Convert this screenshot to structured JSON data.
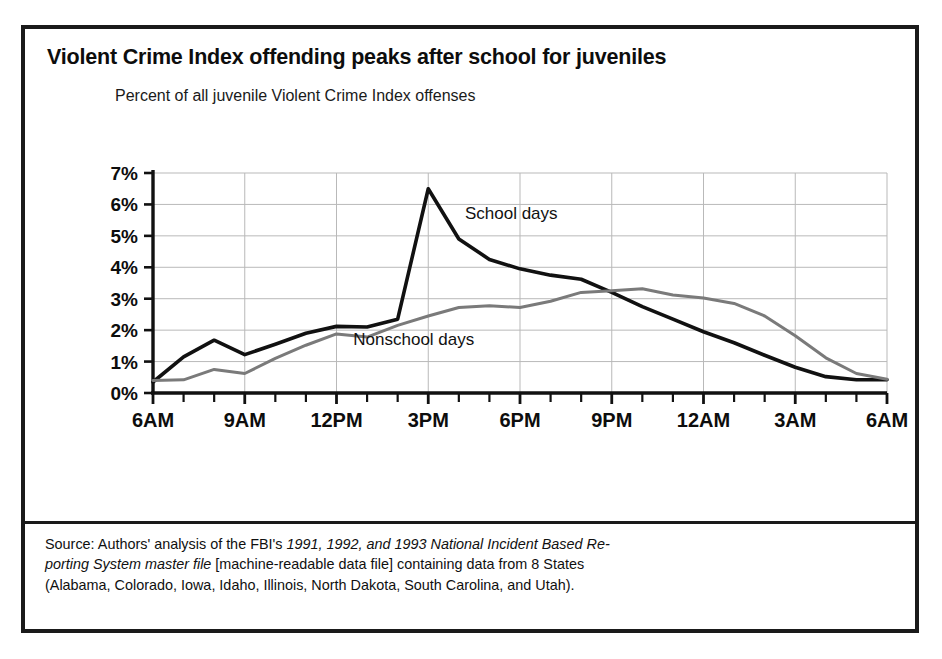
{
  "figure": {
    "title": "Violent Crime Index offending peaks after school for juveniles",
    "subtitle": "Percent of all juvenile Violent Crime Index offenses",
    "source_lines": [
      {
        "segments": [
          {
            "text": "Source: Authors' analysis of the FBI's ",
            "italic": false
          },
          {
            "text": "1991, 1992, and 1993 National Incident Based Re-",
            "italic": true
          }
        ]
      },
      {
        "segments": [
          {
            "text": "porting System master file",
            "italic": true
          },
          {
            "text": " [machine-readable data file] containing data from 8 States",
            "italic": false
          }
        ]
      },
      {
        "segments": [
          {
            "text": "(Alabama, Colorado, Iowa, Idaho, Illinois, North Dakota, South Carolina, and Utah).",
            "italic": false
          }
        ]
      }
    ],
    "colors": {
      "frame": "#1a1a1a",
      "school_days_line": "#111111",
      "nonschool_days_line": "#7a7a7a",
      "gridline": "#b9b9b9",
      "axis": "#111111"
    }
  },
  "chart_data": {
    "type": "line",
    "title": "Violent Crime Index offending peaks after school for juveniles",
    "subtitle": "Percent of all juvenile Violent Crime Index offenses",
    "xlabel": "",
    "ylabel": "Percent of all juvenile Violent Crime Index offenses",
    "ylim": [
      0,
      7
    ],
    "ytick_labels": [
      "0%",
      "1%",
      "2%",
      "3%",
      "4%",
      "5%",
      "6%",
      "7%"
    ],
    "ytick_values": [
      0,
      1,
      2,
      3,
      4,
      5,
      6,
      7
    ],
    "xtick_labels": [
      "6AM",
      "9AM",
      "12PM",
      "3PM",
      "6PM",
      "9PM",
      "12AM",
      "3AM",
      "6AM"
    ],
    "xtick_values": [
      0,
      3,
      6,
      9,
      12,
      15,
      18,
      21,
      24
    ],
    "x_minor_tick_interval_hours": 1,
    "grid": true,
    "legend_position": "inline-annotations",
    "x": [
      0,
      1,
      2,
      3,
      4,
      5,
      6,
      7,
      8,
      9,
      10,
      11,
      12,
      13,
      14,
      15,
      16,
      17,
      18,
      19,
      20,
      21,
      22,
      23,
      24
    ],
    "x_hour_labels": [
      "6AM",
      "7AM",
      "8AM",
      "9AM",
      "10AM",
      "11AM",
      "12PM",
      "1PM",
      "2PM",
      "3PM",
      "4PM",
      "5PM",
      "6PM",
      "7PM",
      "8PM",
      "9PM",
      "10PM",
      "11PM",
      "12AM",
      "1AM",
      "2AM",
      "3AM",
      "4AM",
      "5AM",
      "6AM"
    ],
    "series": [
      {
        "name": "School days",
        "color": "#111111",
        "line_width": 3.6,
        "label_x_hour": 10.2,
        "label_y_value": 5.55,
        "values": [
          0.35,
          1.15,
          1.68,
          1.22,
          1.55,
          1.9,
          2.12,
          2.1,
          2.35,
          6.5,
          4.9,
          4.25,
          3.95,
          3.75,
          3.62,
          3.2,
          2.75,
          2.35,
          1.95,
          1.6,
          1.2,
          0.82,
          0.52,
          0.42,
          0.42
        ]
      },
      {
        "name": "Nonschool days",
        "color": "#7a7a7a",
        "line_width": 3.0,
        "label_x_hour": 6.55,
        "label_y_value": 1.52,
        "values": [
          0.4,
          0.42,
          0.75,
          0.62,
          1.1,
          1.52,
          1.88,
          1.78,
          2.15,
          2.45,
          2.72,
          2.78,
          2.72,
          2.92,
          3.2,
          3.25,
          3.32,
          3.12,
          3.02,
          2.85,
          2.45,
          1.82,
          1.12,
          0.62,
          0.44
        ]
      }
    ],
    "annotations": [
      {
        "text": "School days",
        "x_hour": 10.2,
        "y_value": 5.55
      },
      {
        "text": "Nonschool days",
        "x_hour": 6.55,
        "y_value": 1.52
      }
    ]
  }
}
